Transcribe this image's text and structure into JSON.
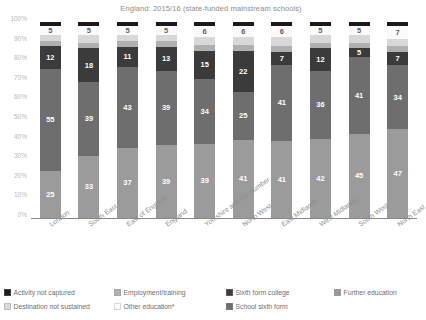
{
  "subtitle": "England: 2015/16 (state-funded mainstream schools)",
  "axis": {
    "yticks": [
      "100%",
      "90%",
      "80%",
      "70%",
      "60%",
      "50%",
      "40%",
      "30%",
      "20%",
      "10%",
      "0%"
    ],
    "ymin": 0,
    "ymax": 100
  },
  "legend": [
    {
      "label": "Activity not captured",
      "color": "#1a1a1a"
    },
    {
      "label": "Employment/training",
      "color": "#b0b0b0"
    },
    {
      "label": "Sixth form college",
      "color": "#3b3b3b"
    },
    {
      "label": "Further education",
      "color": "#9b9b9b"
    },
    {
      "label": "Destination not sustained",
      "color": "#d8d8d8"
    },
    {
      "label": "Other education*",
      "color": "#fafafa"
    },
    {
      "label": "School sixth form",
      "color": "#6e6e6e"
    }
  ],
  "chart_data": {
    "type": "bar",
    "title": "",
    "subtitle": "England: 2015/16 (state-funded mainstream schools)",
    "xlabel": "",
    "ylabel": "",
    "ylim": [
      0,
      100
    ],
    "stacked": true,
    "grid": false,
    "legend_position": "bottom",
    "categories": [
      "London",
      "South East",
      "East of England",
      "England",
      "Yorkshire and the Humber",
      "North West",
      "East Midlands",
      "West Midlands",
      "South West",
      "North East"
    ],
    "series": [
      {
        "name": "Further education",
        "color": "#9b9b9b",
        "values": [
          25,
          33,
          37,
          39,
          39,
          41,
          41,
          42,
          45,
          47
        ]
      },
      {
        "name": "School sixth form",
        "color": "#6e6e6e",
        "values": [
          55,
          39,
          43,
          39,
          34,
          25,
          41,
          36,
          41,
          34
        ]
      },
      {
        "name": "Sixth form college",
        "color": "#3b3b3b",
        "values": [
          12,
          18,
          11,
          13,
          15,
          22,
          7,
          12,
          5,
          7
        ]
      },
      {
        "name": "Employment/training",
        "color": "#b0b0b0",
        "values": [
          3,
          3,
          3,
          3,
          3,
          3,
          3,
          3,
          3,
          3
        ]
      },
      {
        "name": "Destination not sustained",
        "color": "#d8d8d8",
        "values": [
          3,
          4,
          3,
          3,
          4,
          4,
          5,
          4,
          4,
          4
        ]
      },
      {
        "name": "Other education*",
        "color": "#fafafa",
        "values": [
          5,
          5,
          5,
          5,
          6,
          6,
          6,
          5,
          5,
          7
        ]
      },
      {
        "name": "Activity not captured",
        "color": "#1a1a1a",
        "values": [
          2,
          2,
          2,
          2,
          2,
          2,
          2,
          2,
          2,
          2
        ]
      }
    ],
    "data_labels": {
      "Further education": [
        25,
        33,
        37,
        39,
        39,
        41,
        41,
        42,
        45,
        47
      ],
      "School sixth form": [
        55,
        39,
        43,
        39,
        34,
        25,
        41,
        36,
        41,
        34
      ],
      "Sixth form college": [
        12,
        18,
        11,
        13,
        15,
        22,
        7,
        12,
        5,
        7
      ],
      "Other education*": [
        5,
        5,
        5,
        5,
        6,
        6,
        6,
        5,
        5,
        7
      ]
    }
  }
}
